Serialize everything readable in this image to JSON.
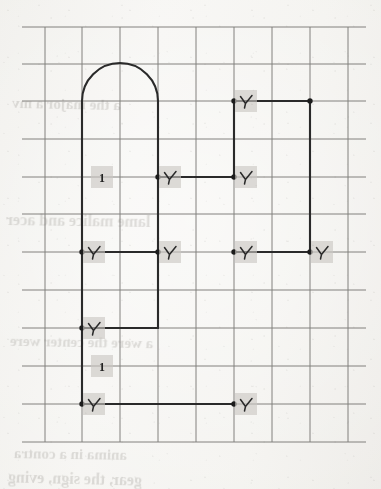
{
  "document": {
    "kind": "scanned-graph-paper-figure",
    "description": "Orthogonal outline with semicircular arch drawn on square grid paper, annotated with tick marks and unit labels",
    "page_width": 381,
    "page_height": 489
  },
  "colors": {
    "paper": "#f3f2ef",
    "grid_line": "#6e6c68",
    "figure_stroke": "#2a2a2a",
    "vertex_dot": "#1c1c1c",
    "highlight_box": "#c9c7c2",
    "ghost_text": "#9b9892"
  },
  "grid": {
    "label": "square grid",
    "cell_size": 38,
    "x_lines": [
      45,
      82,
      120,
      158,
      196,
      234,
      272,
      310,
      348
    ],
    "y_lines": [
      27,
      64,
      101,
      139,
      177,
      214,
      252,
      290,
      328,
      366,
      404,
      442
    ],
    "x_extent": [
      22,
      366
    ],
    "y_extent": [
      27,
      442
    ],
    "stroke_width": 1
  },
  "figure": {
    "name": "arched-orthogonal-outline",
    "stroke_width": 2.1,
    "arch": {
      "label": "semicircular arch",
      "left_x": 82,
      "right_x": 158,
      "base_y": 101,
      "radius": 38,
      "apex_y": 63
    },
    "segments": [
      {
        "name": "left-wall-upper",
        "x1": 82,
        "y1": 101,
        "x2": 82,
        "y2": 177
      },
      {
        "name": "left-wall-mid",
        "x1": 82,
        "y1": 177,
        "x2": 82,
        "y2": 252
      },
      {
        "name": "left-wall-lower",
        "x1": 82,
        "y1": 252,
        "x2": 82,
        "y2": 328
      },
      {
        "name": "left-wall-bottom",
        "x1": 82,
        "y1": 328,
        "x2": 82,
        "y2": 404
      },
      {
        "name": "inner-right-wall",
        "x1": 158,
        "y1": 101,
        "x2": 158,
        "y2": 177
      },
      {
        "name": "mid-shelf-left",
        "x1": 158,
        "y1": 177,
        "x2": 234,
        "y2": 177
      },
      {
        "name": "upper-right-wall",
        "x1": 234,
        "y1": 101,
        "x2": 234,
        "y2": 177
      },
      {
        "name": "top-right-lintel",
        "x1": 234,
        "y1": 101,
        "x2": 310,
        "y2": 101
      },
      {
        "name": "far-right-wall",
        "x1": 310,
        "y1": 101,
        "x2": 310,
        "y2": 252
      },
      {
        "name": "mid-beam-left",
        "x1": 82,
        "y1": 252,
        "x2": 158,
        "y2": 252
      },
      {
        "name": "mid-beam-right",
        "x1": 234,
        "y1": 252,
        "x2": 310,
        "y2": 252
      },
      {
        "name": "inner-drop",
        "x1": 158,
        "y1": 177,
        "x2": 158,
        "y2": 328
      },
      {
        "name": "lower-shelf",
        "x1": 82,
        "y1": 328,
        "x2": 158,
        "y2": 328
      },
      {
        "name": "base-beam",
        "x1": 82,
        "y1": 404,
        "x2": 234,
        "y2": 404
      }
    ],
    "vertices": [
      {
        "name": "vertex-inner-right-mid",
        "x": 158,
        "y": 177
      },
      {
        "name": "vertex-upper-right-mid",
        "x": 234,
        "y": 177
      },
      {
        "name": "vertex-top-right-left",
        "x": 234,
        "y": 101
      },
      {
        "name": "vertex-top-right-right",
        "x": 310,
        "y": 101
      },
      {
        "name": "vertex-mid-left",
        "x": 82,
        "y": 252
      },
      {
        "name": "vertex-mid-inner",
        "x": 158,
        "y": 252
      },
      {
        "name": "vertex-mid-right-left",
        "x": 234,
        "y": 252
      },
      {
        "name": "vertex-mid-right-right",
        "x": 310,
        "y": 252
      },
      {
        "name": "vertex-lower-left",
        "x": 82,
        "y": 328
      },
      {
        "name": "vertex-base-left",
        "x": 82,
        "y": 404
      },
      {
        "name": "vertex-base-right",
        "x": 234,
        "y": 404
      }
    ],
    "tick_marks": [
      {
        "name": "tick-mid-inner-right",
        "x": 170,
        "y": 177
      },
      {
        "name": "tick-mid-upper-right",
        "x": 246,
        "y": 177
      },
      {
        "name": "tick-top-right",
        "x": 246,
        "y": 101
      },
      {
        "name": "tick-beam-left",
        "x": 94,
        "y": 252
      },
      {
        "name": "tick-beam-inner",
        "x": 170,
        "y": 252
      },
      {
        "name": "tick-beam-right-inner",
        "x": 246,
        "y": 252
      },
      {
        "name": "tick-beam-far-right",
        "x": 322,
        "y": 252
      },
      {
        "name": "tick-lower-left",
        "x": 94,
        "y": 328
      },
      {
        "name": "tick-base-left",
        "x": 94,
        "y": 404
      },
      {
        "name": "tick-base-right",
        "x": 246,
        "y": 404
      }
    ],
    "unit_labels": [
      {
        "name": "unit-label-upper",
        "text": "1",
        "x": 102,
        "y": 177
      },
      {
        "name": "unit-label-lower",
        "text": "1",
        "x": 102,
        "y": 366
      }
    ]
  },
  "ghost_text": [
    {
      "name": "ghost-line-1",
      "text": "a the major a mv",
      "x": 12,
      "y": 96,
      "size": 15,
      "rotate": -1.2
    },
    {
      "name": "ghost-line-2",
      "text": "lame malice and acer",
      "x": 6,
      "y": 212,
      "size": 16,
      "rotate": -0.8
    },
    {
      "name": "ghost-line-3",
      "text": "a were the center were",
      "x": 10,
      "y": 334,
      "size": 15,
      "rotate": -1.0
    },
    {
      "name": "ghost-line-4",
      "text": "anima in a contra",
      "x": 14,
      "y": 446,
      "size": 15,
      "rotate": -0.9
    },
    {
      "name": "ghost-line-5",
      "text": "gear, the sign, eving",
      "x": 8,
      "y": 478,
      "size": 16,
      "rotate": -1.4
    }
  ]
}
